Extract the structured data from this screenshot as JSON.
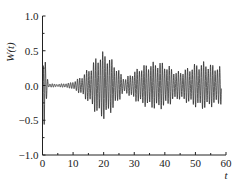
{
  "chart_data": {
    "type": "line",
    "title": "",
    "xlabel": "t",
    "ylabel": "W(t)",
    "xlim": [
      0,
      60
    ],
    "ylim": [
      -1.0,
      1.0
    ],
    "grid": false,
    "legend": null,
    "x_ticks": [
      0,
      10,
      20,
      30,
      40,
      50,
      60
    ],
    "x_tick_labels": [
      "0",
      "10",
      "20",
      "30",
      "40",
      "50",
      "60"
    ],
    "y_ticks": [
      -1.0,
      -0.5,
      0.0,
      0.5,
      1.0
    ],
    "y_tick_labels": [
      "−1.0",
      "−0.5",
      "0.0",
      "0.5",
      "1.0"
    ],
    "series": [
      {
        "name": "W(t)",
        "color": "#1a1a1a",
        "description": "Oscillatory signal: sharp transient near t=0-1 (peak ~0.55, trough ~-0.6), near-flat ~0 for t=2-10, wave packet growing to peak amplitude ~0.5 around t=20, decaying to ~0.1 near t=27, second broad packet t=28-58 with amplitude ~0.35-0.4",
        "envelope": {
          "t": [
            0,
            0.5,
            1,
            2,
            5,
            9,
            11,
            13,
            16,
            18,
            20,
            22,
            24,
            26,
            27,
            29,
            32,
            35,
            38,
            41,
            44,
            47,
            50,
            53,
            56,
            58
          ],
          "amplitude": [
            0.1,
            0.6,
            0.3,
            0.03,
            0.02,
            0.04,
            0.08,
            0.15,
            0.3,
            0.45,
            0.5,
            0.42,
            0.3,
            0.15,
            0.1,
            0.18,
            0.28,
            0.33,
            0.36,
            0.3,
            0.2,
            0.25,
            0.32,
            0.35,
            0.3,
            0.28
          ]
        },
        "carrier_period": 0.75,
        "t_end": 58.5
      }
    ]
  }
}
